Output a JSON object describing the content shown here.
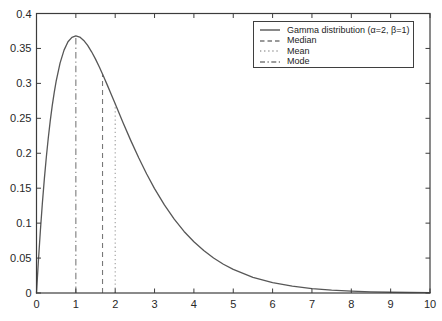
{
  "figure": {
    "background": "#ffffff",
    "axis_color": "#3c3c3c",
    "tick_label_color": "#282828",
    "tick_label_font_px": 11
  },
  "legend": {
    "border_color": "#3f3f3f",
    "items": [
      {
        "label": "Gamma distribution (α=2, β=1)",
        "style": "solid",
        "color": "#575757"
      },
      {
        "label": "Median",
        "style": "dashed",
        "color": "#787878"
      },
      {
        "label": "Mean",
        "style": "dotted",
        "color": "#9d9d9d"
      },
      {
        "label": "Mode",
        "style": "dashdot",
        "color": "#7c7c7c"
      }
    ]
  },
  "chart_data": {
    "type": "line",
    "title": "",
    "xlabel": "",
    "ylabel": "",
    "xlim": [
      0,
      10
    ],
    "ylim": [
      0,
      0.4
    ],
    "x_ticks": [
      0,
      1,
      2,
      3,
      4,
      5,
      6,
      7,
      8,
      9,
      10
    ],
    "x_tick_labels": [
      "0",
      "1",
      "2",
      "3",
      "4",
      "5",
      "6",
      "7",
      "8",
      "9",
      "10"
    ],
    "y_ticks": [
      0,
      0.05,
      0.1,
      0.15,
      0.2,
      0.25,
      0.3,
      0.35,
      0.4
    ],
    "y_tick_labels": [
      "0",
      "0.05",
      "0.1",
      "0.15",
      "0.2",
      "0.25",
      "0.3",
      "0.35",
      "0.4"
    ],
    "grid": false,
    "legend_position": "upper right",
    "series": [
      {
        "name": "Gamma distribution (α=2, β=1)",
        "style": "solid",
        "color": "#575757",
        "x": [
          0,
          0.05,
          0.1,
          0.15,
          0.2,
          0.25,
          0.3,
          0.35,
          0.4,
          0.45,
          0.5,
          0.6,
          0.7,
          0.8,
          0.9,
          1.0,
          1.1,
          1.2,
          1.3,
          1.4,
          1.5,
          1.6,
          1.7,
          1.8,
          1.9,
          2.0,
          2.2,
          2.4,
          2.6,
          2.8,
          3.0,
          3.25,
          3.5,
          3.75,
          4.0,
          4.25,
          4.5,
          4.75,
          5.0,
          5.5,
          6.0,
          6.5,
          7.0,
          7.5,
          8.0,
          8.5,
          9.0,
          9.5,
          10.0
        ],
        "y": [
          0,
          0.0476,
          0.0905,
          0.1291,
          0.1637,
          0.1947,
          0.2222,
          0.2466,
          0.2681,
          0.2869,
          0.3033,
          0.3293,
          0.3476,
          0.3595,
          0.3659,
          0.3679,
          0.3662,
          0.3614,
          0.3543,
          0.3452,
          0.3347,
          0.323,
          0.3106,
          0.2975,
          0.2842,
          0.2707,
          0.2438,
          0.2177,
          0.1931,
          0.1703,
          0.1494,
          0.1261,
          0.1057,
          0.0881,
          0.0733,
          0.0607,
          0.05,
          0.0411,
          0.0337,
          0.0225,
          0.0149,
          0.0098,
          0.0064,
          0.0041,
          0.0027,
          0.0017,
          0.0011,
          0.0007,
          0.0005
        ]
      }
    ],
    "vlines": [
      {
        "name": "Mode",
        "x": 1.0,
        "y_top": 0.3679,
        "style": "dashdot",
        "color": "#7c7c7c"
      },
      {
        "name": "Median",
        "x": 1.678,
        "y_top": 0.3133,
        "style": "dashed",
        "color": "#787878"
      },
      {
        "name": "Mean",
        "x": 2.0,
        "y_top": 0.2707,
        "style": "dotted",
        "color": "#9d9d9d"
      }
    ]
  }
}
